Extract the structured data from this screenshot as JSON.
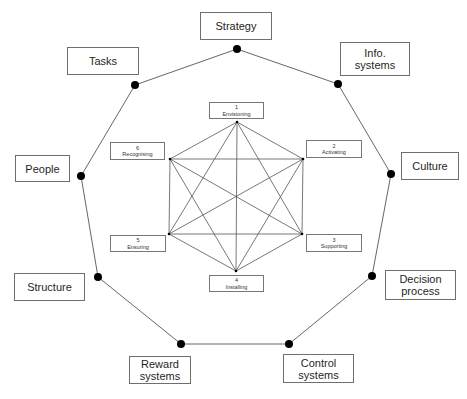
{
  "diagram": {
    "outer_elements": [
      {
        "id": "strategy",
        "label": "Strategy",
        "node": [
          237,
          49
        ],
        "box": [
          200,
          12,
          72,
          28
        ]
      },
      {
        "id": "info-systems",
        "label": "Info.\nsystems",
        "node": [
          338,
          84
        ],
        "box": [
          340,
          42,
          70,
          34
        ]
      },
      {
        "id": "culture",
        "label": "Culture",
        "node": [
          391,
          174
        ],
        "box": [
          401,
          152,
          58,
          28
        ]
      },
      {
        "id": "decision-process",
        "label": "Decision\nprocess",
        "node": [
          372,
          276
        ],
        "box": [
          385,
          270,
          71,
          30
        ]
      },
      {
        "id": "control-systems",
        "label": "Control\nsystems",
        "node": [
          289,
          344
        ],
        "box": [
          283,
          354,
          71,
          29
        ]
      },
      {
        "id": "reward-systems",
        "label": "Reward\nsystems",
        "node": [
          181,
          344
        ],
        "box": [
          129,
          356,
          62,
          28
        ]
      },
      {
        "id": "structure",
        "label": "Structure",
        "node": [
          98,
          277
        ],
        "box": [
          14,
          273,
          71,
          28
        ]
      },
      {
        "id": "people",
        "label": "People",
        "node": [
          81,
          176
        ],
        "box": [
          15,
          155,
          55,
          27
        ]
      },
      {
        "id": "tasks",
        "label": "Tasks",
        "node": [
          135,
          85
        ],
        "box": [
          67,
          47,
          72,
          28
        ]
      }
    ],
    "inner_elements": [
      {
        "id": "envisioning",
        "number": "1",
        "label": "Envisioning",
        "node": [
          237,
          122
        ],
        "box": [
          209,
          102,
          55,
          17
        ]
      },
      {
        "id": "activating",
        "number": "2",
        "label": "Activating",
        "node": [
          303,
          159
        ],
        "box": [
          306,
          140,
          56,
          18
        ]
      },
      {
        "id": "supporting",
        "number": "3",
        "label": "Supporting",
        "node": [
          302,
          234
        ],
        "box": [
          306,
          234,
          56,
          18
        ]
      },
      {
        "id": "installing",
        "number": "4",
        "label": "Installing",
        "node": [
          236,
          271
        ],
        "box": [
          209,
          275,
          55,
          17
        ]
      },
      {
        "id": "ensuring",
        "number": "5",
        "label": "Ensuring",
        "node": [
          169,
          234
        ],
        "box": [
          110,
          235,
          56,
          17
        ]
      },
      {
        "id": "recognising",
        "number": "6",
        "label": "Recognising",
        "node": [
          170,
          159
        ],
        "box": [
          110,
          142,
          55,
          18
        ]
      }
    ],
    "colors": {
      "line": "#555555",
      "node": "#000000",
      "box_border": "#6f6f6f",
      "text": "#1f1f1f"
    }
  }
}
